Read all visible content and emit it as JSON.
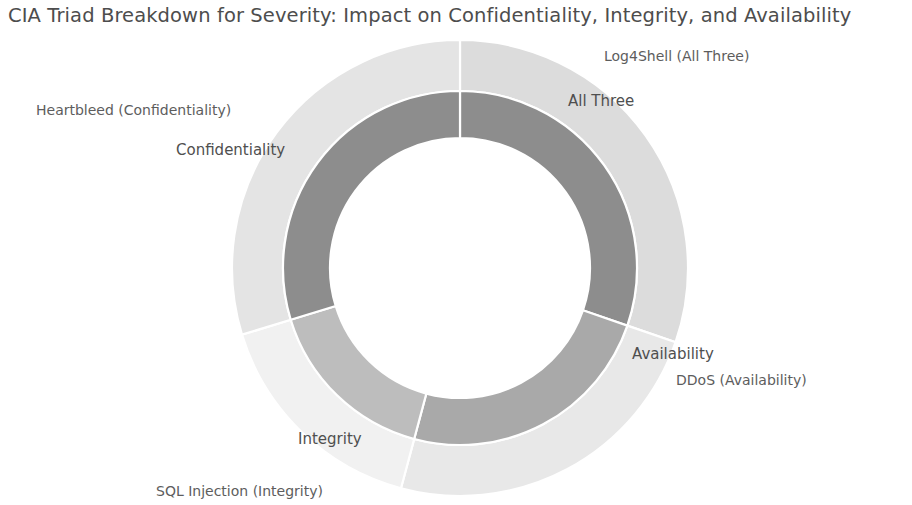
{
  "chart_data": {
    "type": "pie",
    "variant": "nested-donut-sunburst",
    "title": "CIA Triad Breakdown for Severity: Impact on Confidentiality, Integrity, and Availability",
    "xlabel": "",
    "ylabel": "",
    "legend": "none",
    "grid": false,
    "geometry": {
      "center_x": 460,
      "center_y": 268,
      "outer_radius": 228,
      "ring_boundary_radius": 177,
      "hole_radius": 130,
      "start_angle_deg": 0,
      "direction": "clockwise"
    },
    "rings": [
      {
        "name": "inner",
        "level": 1,
        "categories": [
          "All Three",
          "Availability",
          "Integrity",
          "Confidentiality"
        ],
        "values": [
          30.3,
          23.9,
          16.1,
          29.7
        ],
        "start_angles_deg": [
          0,
          109,
          195,
          253
        ],
        "end_angles_deg": [
          109,
          195,
          253,
          360
        ],
        "colors": [
          "#8d8d8d",
          "#a9a9a9",
          "#bdbdbd",
          "#8d8d8d"
        ]
      },
      {
        "name": "outer",
        "level": 2,
        "categories": [
          "Log4Shell (All Three)",
          "DDoS (Availability)",
          "SQL Injection (Integrity)",
          "Heartbleed (Confidentiality)"
        ],
        "values": [
          30.3,
          23.9,
          16.1,
          29.7
        ],
        "start_angles_deg": [
          0,
          109,
          195,
          253
        ],
        "end_angles_deg": [
          109,
          195,
          253,
          360
        ],
        "colors": [
          "#dcdcdc",
          "#e8e8e8",
          "#f1f1f1",
          "#e4e4e4"
        ]
      }
    ],
    "labels": [
      {
        "text": "Log4Shell (All Three)",
        "ring": "outer",
        "x": 604,
        "y": 48
      },
      {
        "text": "All Three",
        "ring": "inner",
        "x": 568,
        "y": 92
      },
      {
        "text": "Availability",
        "ring": "inner",
        "x": 632,
        "y": 345
      },
      {
        "text": "DDoS (Availability)",
        "ring": "outer",
        "x": 676,
        "y": 372
      },
      {
        "text": "Integrity",
        "ring": "inner",
        "x": 298,
        "y": 430
      },
      {
        "text": "SQL Injection (Integrity)",
        "ring": "outer",
        "x": 156,
        "y": 483
      },
      {
        "text": "Heartbleed (Confidentiality)",
        "ring": "outer",
        "x": 36,
        "y": 102
      },
      {
        "text": "Confidentiality",
        "ring": "inner",
        "x": 176,
        "y": 141
      }
    ],
    "colors": {
      "title": "#4d4d4d",
      "label": "#5a5a5a",
      "background": "#ffffff",
      "divider": "#ffffff"
    }
  }
}
